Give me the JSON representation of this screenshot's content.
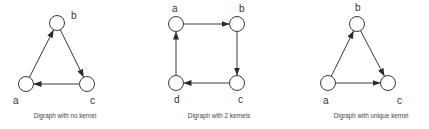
{
  "figure": {
    "colors": {
      "stroke": "#3a3a3a",
      "text": "#333333",
      "background": "#ffffff"
    },
    "node_radius": 7.5,
    "graphs": [
      {
        "id": "no-kernel",
        "caption": "Digraph with no kernel",
        "caption_pos": [
          65,
          118
        ],
        "nodes": [
          {
            "id": "a",
            "label": "a",
            "x": 26,
            "y": 84,
            "label_x": 13,
            "label_y": 104
          },
          {
            "id": "b",
            "label": "b",
            "x": 57,
            "y": 23,
            "label_x": 71,
            "label_y": 19
          },
          {
            "id": "c",
            "label": "c",
            "x": 87,
            "y": 84,
            "label_x": 90,
            "label_y": 104
          }
        ],
        "edges": [
          {
            "from": "a",
            "to": "b"
          },
          {
            "from": "b",
            "to": "c"
          },
          {
            "from": "c",
            "to": "a"
          }
        ]
      },
      {
        "id": "two-kernels",
        "caption": "Digraph with 2 kernels",
        "caption_pos": [
          219,
          118
        ],
        "nodes": [
          {
            "id": "a",
            "label": "a",
            "x": 176,
            "y": 24,
            "label_x": 172,
            "label_y": 12
          },
          {
            "id": "b",
            "label": "b",
            "x": 237,
            "y": 24,
            "label_x": 239,
            "label_y": 12
          },
          {
            "id": "c",
            "label": "c",
            "x": 237,
            "y": 83,
            "label_x": 238,
            "label_y": 103
          },
          {
            "id": "d",
            "label": "d",
            "x": 176,
            "y": 83,
            "label_x": 174,
            "label_y": 103
          }
        ],
        "edges": [
          {
            "from": "a",
            "to": "b"
          },
          {
            "from": "b",
            "to": "c"
          },
          {
            "from": "c",
            "to": "d"
          },
          {
            "from": "d",
            "to": "a"
          }
        ]
      },
      {
        "id": "unique-kernel",
        "caption": "Digraph with unique kernel",
        "caption_pos": [
          371,
          118
        ],
        "nodes": [
          {
            "id": "a",
            "label": "a",
            "x": 328,
            "y": 83,
            "label_x": 323,
            "label_y": 104
          },
          {
            "id": "b",
            "label": "b",
            "x": 357,
            "y": 24,
            "label_x": 355,
            "label_y": 11
          },
          {
            "id": "c",
            "label": "c",
            "x": 388,
            "y": 83,
            "label_x": 397,
            "label_y": 104
          }
        ],
        "edges": [
          {
            "from": "a",
            "to": "b"
          },
          {
            "from": "b",
            "to": "c"
          },
          {
            "from": "a",
            "to": "c"
          }
        ]
      }
    ]
  }
}
